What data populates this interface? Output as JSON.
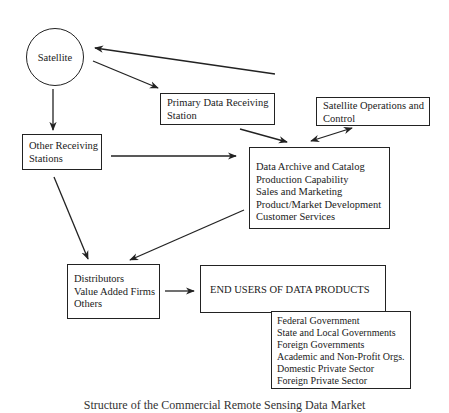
{
  "diagram": {
    "satellite": {
      "label": "Satellite"
    },
    "primary_station": {
      "lines": [
        "Primary Data Receiving",
        "Station"
      ]
    },
    "satellite_ops": {
      "lines": [
        "Satellite Operations and",
        "Control"
      ]
    },
    "other_stations": {
      "lines": [
        "Other Receiving",
        "Stations"
      ]
    },
    "data_center": {
      "lines": [
        "Data Archive and Catalog",
        "Production Capability",
        "Sales and Marketing",
        "Product/Market Development",
        "Customer Services"
      ]
    },
    "distributors": {
      "lines": [
        "Distributors",
        "Value Added Firms",
        "Others"
      ]
    },
    "end_users": {
      "title": "END USERS OF DATA PRODUCTS"
    },
    "end_user_types": {
      "lines": [
        "Federal Government",
        "State and Local Governments",
        "Foreign Governments",
        "Academic and Non-Profit Orgs.",
        "Domestic Private Sector",
        "Foreign Private Sector"
      ]
    },
    "edges": [
      {
        "from": "satellite_ops",
        "to": "satellite"
      },
      {
        "from": "satellite",
        "to": "primary_station"
      },
      {
        "from": "satellite",
        "to": "other_stations"
      },
      {
        "from": "primary_station",
        "to": "data_center"
      },
      {
        "from": "satellite_ops",
        "to": "data_center",
        "bidirectional": true
      },
      {
        "from": "other_stations",
        "to": "data_center"
      },
      {
        "from": "other_stations",
        "to": "distributors"
      },
      {
        "from": "data_center",
        "to": "distributors"
      },
      {
        "from": "distributors",
        "to": "end_users"
      }
    ]
  },
  "caption": "Structure of the Commercial Remote Sensing Data Market"
}
